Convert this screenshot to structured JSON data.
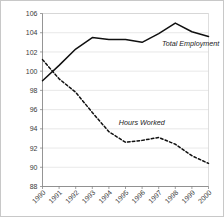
{
  "chart_data": {
    "type": "line",
    "title": "",
    "subtitle": "",
    "xlabel": "",
    "ylabel": "",
    "categories": [
      "1990",
      "1991",
      "1992",
      "1993",
      "1994",
      "1995",
      "1996",
      "1997",
      "1998",
      "1999",
      "2000"
    ],
    "x": [
      1990,
      1991,
      1992,
      1993,
      1994,
      1995,
      1996,
      1997,
      1998,
      1999,
      2000
    ],
    "series": [
      {
        "name": "Total Employment",
        "style": "solid",
        "values": [
          99.0,
          100.6,
          102.3,
          103.5,
          103.3,
          103.3,
          103.0,
          103.9,
          105.0,
          104.1,
          103.6
        ]
      },
      {
        "name": "Hours Worked",
        "style": "dashed",
        "values": [
          101.2,
          99.2,
          97.8,
          95.7,
          93.7,
          92.6,
          92.8,
          93.1,
          92.4,
          91.2,
          90.4
        ]
      }
    ],
    "ylim": [
      88,
      106
    ],
    "xlim": [
      1990,
      2000
    ],
    "yticks": [
      88,
      90,
      92,
      94,
      96,
      98,
      100,
      102,
      104,
      106
    ],
    "ytick_labels": [
      "88",
      "90",
      "92",
      "94",
      "96",
      "98",
      "100",
      "102",
      "104",
      "106"
    ],
    "xtick_labels": [
      "1990",
      "1991",
      "1992",
      "1993",
      "1994",
      "1995",
      "1996",
      "1997",
      "1998",
      "1999",
      "2000"
    ],
    "grid": true,
    "grid_axis": "y",
    "legend": "inline-annotations",
    "annotations": [
      {
        "text": "Total Employment",
        "x": 1997.2,
        "y": 102.6
      },
      {
        "text": "Hours Worked",
        "x": 1994.6,
        "y": 94.4
      }
    ],
    "colors": {
      "line": "#101010",
      "grid": "#d9d9d9",
      "axis": "#7a7a7a",
      "background": "#ffffff",
      "border": "#c8c8c8"
    }
  }
}
